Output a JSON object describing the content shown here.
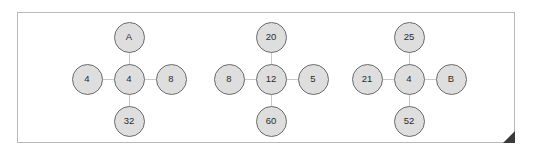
{
  "diagram": {
    "title": "",
    "type": "node-cross-diagram",
    "frame": {
      "border_color": "#b9b9b9",
      "background": "#ffffff"
    },
    "style": {
      "node_fill": "#dedede",
      "node_stroke": "#6b6b6b",
      "edge_color": "#c9c9c9",
      "text_color": "#2b2b2b",
      "fold_color": "#3a3a3a"
    },
    "groups": [
      {
        "id": "group-1",
        "center_x": 129,
        "center_y": 79,
        "nodes": {
          "center": "4",
          "top": "A",
          "bottom": "32",
          "left": "4",
          "right": "8"
        }
      },
      {
        "id": "group-2",
        "center_x": 271,
        "center_y": 79,
        "nodes": {
          "center": "12",
          "top": "20",
          "bottom": "60",
          "left": "8",
          "right": "5"
        }
      },
      {
        "id": "group-3",
        "center_x": 409,
        "center_y": 79,
        "nodes": {
          "center": "4",
          "top": "25",
          "bottom": "52",
          "left": "21",
          "right": "B"
        }
      }
    ]
  }
}
